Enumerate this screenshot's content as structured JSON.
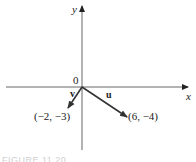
{
  "figure": {
    "axes": {
      "x_label": "x",
      "y_label": "y",
      "origin_label": "0"
    },
    "vectors": [
      {
        "name": "v",
        "label": "v",
        "endpoint_label": "(−2, −3)",
        "components": [
          -2,
          -3
        ]
      },
      {
        "name": "u",
        "label": "u",
        "endpoint_label": "(6, −4)",
        "components": [
          6,
          -4
        ]
      }
    ],
    "caption": "FIGURE 11.20"
  },
  "colors": {
    "axis": "#555555",
    "vector": "#333333",
    "text": "#222222"
  }
}
